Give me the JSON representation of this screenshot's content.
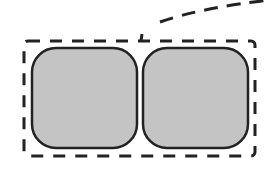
{
  "diagram": {
    "group_box": {
      "x": 24,
      "y": 41,
      "width": 231,
      "height": 115,
      "style": "dashed",
      "stroke": "#222222"
    },
    "nodes": [
      {
        "id": "left",
        "x": 32,
        "y": 48,
        "width": 105,
        "height": 100,
        "fill": "#c4c4c4",
        "stroke": "#222222"
      },
      {
        "id": "right",
        "x": 143,
        "y": 48,
        "width": 105,
        "height": 100,
        "fill": "#c4c4c4",
        "stroke": "#222222"
      }
    ],
    "connector": {
      "style": "dashed",
      "stroke": "#222222"
    }
  }
}
